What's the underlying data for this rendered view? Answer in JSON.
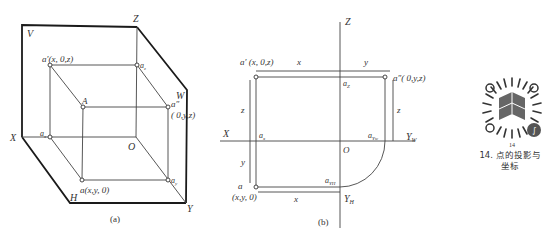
{
  "diagram_a": {
    "caption": "(a)",
    "plane_labels": {
      "V": "V",
      "W": "W",
      "H": "H"
    },
    "axis_labels": {
      "X": "X",
      "Y": "Y",
      "Z": "Z",
      "O": "O"
    },
    "points": {
      "a_prime": "a′(x, 0,z)",
      "A": "A",
      "a_z": "a",
      "a_z_sub": "z",
      "a_double_prime": "a″",
      "a_double_prime_coords": "( 0,y,z)",
      "a_x": "a",
      "a_x_sub": "x",
      "a": "a(x,y, 0)",
      "a_y": "a",
      "a_y_sub": "y"
    }
  },
  "diagram_b": {
    "caption": "(b)",
    "axis_labels": {
      "Z": "Z",
      "X": "X",
      "O": "O",
      "Y_W": "Y",
      "Y_W_sub": "W",
      "Y_H": "Y",
      "Y_H_sub": "H"
    },
    "points": {
      "a_prime": "a′ (x, 0,z)",
      "a_double_prime": "a″( 0,y,z)",
      "a_z": "a",
      "a_z_sub": "Z",
      "a_x": "a",
      "a_x_sub": "x",
      "a_YW": "a",
      "a_YW_sub": "Yw",
      "a_YH": "a",
      "a_YH_sub": "YH",
      "a": "a",
      "a_coords": "(x,y, 0)"
    },
    "dimension_labels": {
      "x_top": "x",
      "y_top": "y",
      "z_left": "z",
      "z_right": "z",
      "y_left": "y",
      "x_bottom": "x"
    }
  },
  "qr_panel": {
    "icon": "mini-program-code-icon",
    "number": "14",
    "caption_line1": "14. 点的投影与",
    "caption_line2": "坐标"
  }
}
